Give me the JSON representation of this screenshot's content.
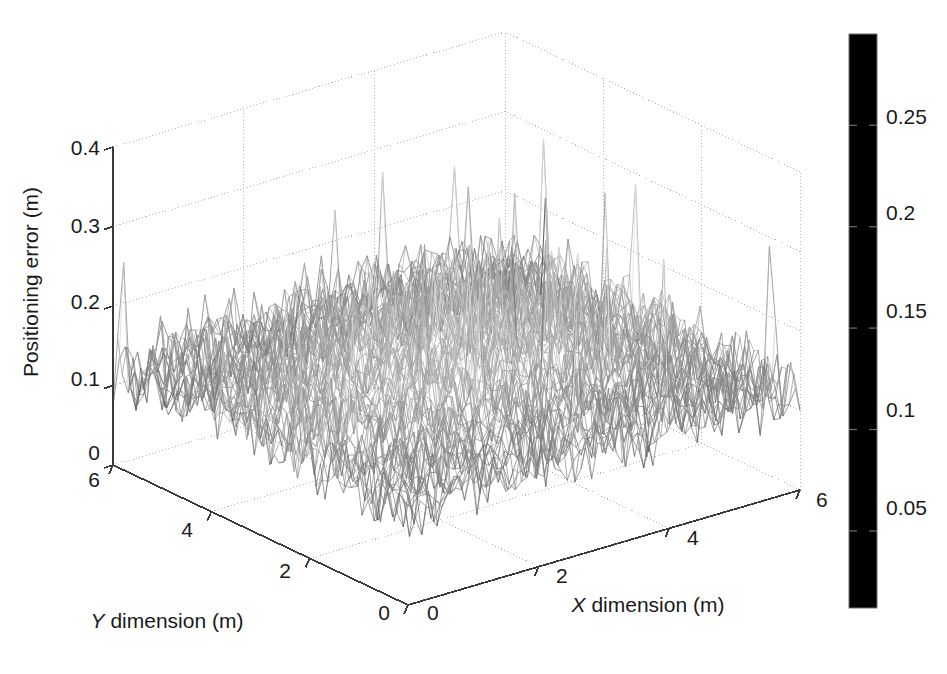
{
  "figure": {
    "background": "#ffffff",
    "type": "3d-mesh-surface-plot"
  },
  "chart_data": {
    "type": "surface",
    "title": "",
    "subtitle": "",
    "xlabel": "X dimension (m)",
    "ylabel": "Y dimension (m)",
    "zlabel": "Positioning error (m)",
    "xlim": [
      0,
      6
    ],
    "ylim": [
      0,
      6
    ],
    "zlim": [
      0,
      0.4
    ],
    "xticks": [
      0,
      2,
      4,
      6
    ],
    "xticklabels": [
      "0",
      "2",
      "4",
      "6"
    ],
    "yticks": [
      0,
      2,
      4,
      6
    ],
    "yticklabels": [
      "0",
      "2",
      "4",
      "6"
    ],
    "zticks": [
      0,
      0.1,
      0.2,
      0.3,
      0.4
    ],
    "zticklabels": [
      "0",
      "0.1",
      "0.2",
      "0.3",
      "0.4"
    ],
    "grid": true,
    "grid_style": "dotted",
    "colormap": "grayscale-jet",
    "colorbar": {
      "position": "right",
      "ticks": [
        0.05,
        0.1,
        0.15,
        0.2,
        0.25
      ],
      "ticklabels": [
        "0.05",
        "0.1",
        "0.15",
        "0.2",
        "0.25"
      ],
      "vmin": 0.012,
      "vmax": 0.295,
      "stops": [
        {
          "pos": 0.0,
          "color": "#000000"
        },
        {
          "pos": 0.1,
          "color": "#0d0d0d"
        },
        {
          "pos": 0.22,
          "color": "#2e2e2e"
        },
        {
          "pos": 0.34,
          "color": "#636363"
        },
        {
          "pos": 0.46,
          "color": "#8f8f8f"
        },
        {
          "pos": 0.56,
          "color": "#b5b5b5"
        },
        {
          "pos": 0.64,
          "color": "#d2d2d2"
        },
        {
          "pos": 0.7,
          "color": "#e8e8e8"
        },
        {
          "pos": 0.745,
          "color": "#f2f2f2"
        },
        {
          "pos": 0.78,
          "color": "#dcdcdc"
        },
        {
          "pos": 0.84,
          "color": "#a8a8a8"
        },
        {
          "pos": 0.9,
          "color": "#5c5c5c"
        },
        {
          "pos": 0.96,
          "color": "#1f1f1f"
        },
        {
          "pos": 1.0,
          "color": "#000000"
        }
      ]
    },
    "data_summary": {
      "grid_nx": 64,
      "grid_ny": 64,
      "mean": 0.095,
      "noise_amplitude": 0.06,
      "peak_center_x": 3.0,
      "peak_center_y": 3.0,
      "peak_height": 0.3
    }
  },
  "geometry": {
    "origin": [
      408,
      605
    ],
    "x_front_right": [
      800,
      490
    ],
    "y_front_left": [
      113,
      465
    ],
    "z_height_px": 318,
    "back_apex": [
      498,
      35
    ]
  },
  "colorbar_labels": {
    "t0": "0.25",
    "t1": "0.2",
    "t2": "0.15",
    "t3": "0.1",
    "t4": "0.05"
  },
  "axis_labels": {
    "z0": "0",
    "z1": "0.1",
    "z2": "0.2",
    "z3": "0.3",
    "z4": "0.4",
    "y0": "0",
    "y2": "2",
    "y4": "4",
    "y6": "6",
    "x0": "0",
    "x2": "2",
    "x4": "4",
    "x6": "6",
    "x_title_a": "X",
    "x_title_b": " dimension (m)",
    "y_title_a": "Y",
    "y_title_b": " dimension (m)",
    "z_title": "Positioning error (m)"
  }
}
